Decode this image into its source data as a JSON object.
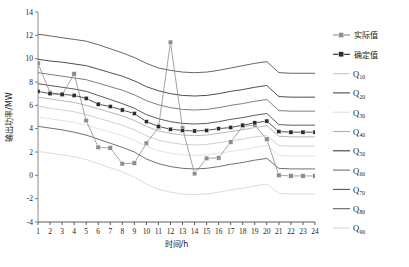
{
  "chart_data": {
    "type": "line",
    "title": "",
    "xlabel": "时间/h",
    "ylabel": "输出功率/MW",
    "xlim": [
      1,
      24
    ],
    "ylim": [
      -4,
      14
    ],
    "yticks": [
      -4,
      -2,
      0,
      2,
      4,
      6,
      8,
      10,
      12,
      14
    ],
    "xticks": [
      1,
      2,
      3,
      4,
      5,
      6,
      7,
      8,
      9,
      10,
      11,
      12,
      13,
      14,
      15,
      16,
      17,
      18,
      19,
      20,
      21,
      22,
      23,
      24
    ],
    "grid": false,
    "legend_position": "right",
    "x": [
      1,
      2,
      3,
      4,
      5,
      6,
      7,
      8,
      9,
      10,
      11,
      12,
      13,
      14,
      15,
      16,
      17,
      18,
      19,
      20,
      21,
      22,
      23,
      24
    ],
    "series": [
      {
        "name": "实际值",
        "style": "line-marker",
        "color": "#8c8c8c",
        "values": [
          9.6,
          7.1,
          6.9,
          8.7,
          4.7,
          2.4,
          2.35,
          1.0,
          1.05,
          2.75,
          4.1,
          11.4,
          4.05,
          0.15,
          1.45,
          1.5,
          2.85,
          4.2,
          4.3,
          3.1,
          0.0,
          -0.05,
          -0.05,
          -0.05
        ]
      },
      {
        "name": "确定值",
        "style": "line-marker",
        "color": "#2b2b2b",
        "values": [
          7.2,
          7.0,
          6.95,
          6.85,
          6.6,
          6.1,
          5.9,
          5.6,
          5.3,
          4.6,
          4.2,
          3.95,
          3.85,
          3.8,
          3.85,
          4.0,
          4.1,
          4.3,
          4.5,
          4.65,
          3.75,
          3.7,
          3.7,
          3.7
        ]
      },
      {
        "name": "Q10",
        "style": "line",
        "color": "#c9c9c9",
        "values": [
          5.95,
          5.75,
          5.6,
          5.45,
          5.2,
          4.9,
          4.6,
          4.3,
          3.9,
          3.4,
          3.0,
          2.8,
          2.65,
          2.6,
          2.65,
          2.8,
          2.95,
          3.1,
          3.3,
          3.4,
          2.55,
          2.5,
          2.5,
          2.5
        ]
      },
      {
        "name": "Q20",
        "style": "line",
        "color": "#4a4a4a",
        "values": [
          7.85,
          7.7,
          7.55,
          7.4,
          7.2,
          6.85,
          6.5,
          6.15,
          5.75,
          5.2,
          4.85,
          4.6,
          4.45,
          4.4,
          4.45,
          4.6,
          4.8,
          4.95,
          5.15,
          5.3,
          4.35,
          4.3,
          4.3,
          4.3
        ]
      },
      {
        "name": "Q30",
        "style": "line",
        "color": "#e0e0e0",
        "values": [
          5.0,
          4.85,
          4.7,
          4.55,
          4.3,
          4.0,
          3.7,
          3.4,
          3.0,
          2.5,
          2.1,
          1.9,
          1.75,
          1.7,
          1.75,
          1.9,
          2.05,
          2.2,
          2.4,
          2.55,
          1.7,
          1.65,
          1.65,
          1.65
        ]
      },
      {
        "name": "Q40",
        "style": "line",
        "color": "#b0b0b0",
        "values": [
          6.7,
          6.55,
          6.4,
          6.25,
          6.0,
          5.7,
          5.4,
          5.1,
          4.7,
          4.2,
          3.8,
          3.6,
          3.45,
          3.4,
          3.45,
          3.6,
          3.75,
          3.9,
          4.1,
          4.25,
          3.35,
          3.3,
          3.3,
          3.3
        ]
      },
      {
        "name": "Q50",
        "style": "line",
        "color": "#3a3a3a",
        "values": [
          9.95,
          9.8,
          9.7,
          9.55,
          9.4,
          9.1,
          8.8,
          8.5,
          8.1,
          7.6,
          7.25,
          7.0,
          6.85,
          6.8,
          6.85,
          7.0,
          7.2,
          7.35,
          7.55,
          7.7,
          6.75,
          6.7,
          6.7,
          6.7
        ]
      },
      {
        "name": "Q60",
        "style": "line",
        "color": "#707070",
        "values": [
          8.8,
          8.65,
          8.5,
          8.35,
          8.2,
          7.9,
          7.6,
          7.3,
          6.9,
          6.4,
          6.05,
          5.8,
          5.65,
          5.6,
          5.65,
          5.8,
          6.0,
          6.15,
          6.35,
          6.5,
          5.55,
          5.5,
          5.5,
          5.5
        ]
      },
      {
        "name": "Q70",
        "style": "line",
        "color": "#555555",
        "values": [
          12.1,
          11.95,
          11.8,
          11.65,
          11.5,
          11.2,
          10.85,
          10.5,
          10.1,
          9.6,
          9.2,
          9.0,
          8.85,
          8.8,
          8.85,
          9.0,
          9.2,
          9.4,
          9.6,
          9.75,
          8.8,
          8.75,
          8.75,
          8.75
        ]
      },
      {
        "name": "Q80",
        "style": "line",
        "color": "#606060",
        "values": [
          4.2,
          4.05,
          3.9,
          3.7,
          3.45,
          3.1,
          2.75,
          2.4,
          2.0,
          1.4,
          1.0,
          0.75,
          0.6,
          0.55,
          0.6,
          0.75,
          0.95,
          1.1,
          1.3,
          1.45,
          0.6,
          0.55,
          0.55,
          0.55
        ]
      },
      {
        "name": "Q90",
        "style": "line",
        "color": "#d8d8d8",
        "values": [
          2.05,
          1.9,
          1.75,
          1.6,
          1.35,
          1.0,
          0.65,
          0.3,
          -0.15,
          -0.75,
          -1.2,
          -1.45,
          -1.6,
          -1.65,
          -1.6,
          -1.45,
          -1.25,
          -1.1,
          -0.9,
          -0.75,
          -1.55,
          -1.6,
          -1.6,
          -1.6
        ]
      }
    ]
  },
  "legend": {
    "items": [
      {
        "label": "实际值",
        "kind": "marker",
        "color": "#8c8c8c"
      },
      {
        "label": "确定值",
        "kind": "marker",
        "color": "#2b2b2b"
      },
      {
        "label": "Q",
        "sub": "10",
        "kind": "line",
        "color": "#c9c9c9"
      },
      {
        "label": "Q",
        "sub": "20",
        "kind": "line",
        "color": "#4a4a4a"
      },
      {
        "label": "Q",
        "sub": "30",
        "kind": "line",
        "color": "#e0e0e0"
      },
      {
        "label": "Q",
        "sub": "40",
        "kind": "line",
        "color": "#b0b0b0"
      },
      {
        "label": "Q",
        "sub": "50",
        "kind": "line",
        "color": "#3a3a3a"
      },
      {
        "label": "Q",
        "sub": "60",
        "kind": "line",
        "color": "#707070"
      },
      {
        "label": "Q",
        "sub": "70",
        "kind": "line",
        "color": "#555555"
      },
      {
        "label": "Q",
        "sub": "80",
        "kind": "line",
        "color": "#606060"
      },
      {
        "label": "Q",
        "sub": "90",
        "kind": "line",
        "color": "#d8d8d8"
      }
    ]
  },
  "axes": {
    "x_title": "时间/h",
    "y_title": "输出功率/MW"
  }
}
